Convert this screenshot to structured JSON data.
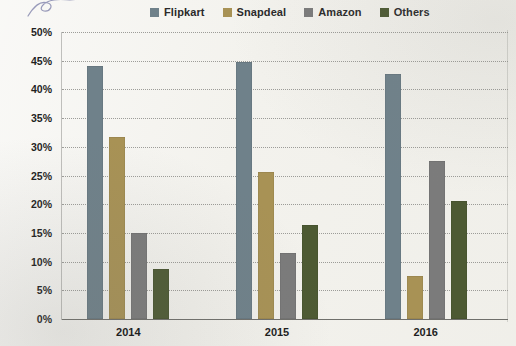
{
  "legend": {
    "items": [
      {
        "label": "Flipkart",
        "color": "#6f818a"
      },
      {
        "label": "Snapdeal",
        "color": "#a89255"
      },
      {
        "label": "Amazon",
        "color": "#7b7b7b"
      },
      {
        "label": "Others",
        "color": "#4d5a33"
      }
    ]
  },
  "chart_data": {
    "type": "bar",
    "title": "",
    "xlabel": "",
    "ylabel": "",
    "categories": [
      "2014",
      "2015",
      "2016"
    ],
    "series": [
      {
        "name": "Flipkart",
        "color": "#6f818a",
        "values": [
          44.0,
          44.7,
          42.6
        ]
      },
      {
        "name": "Snapdeal",
        "color": "#a89255",
        "values": [
          31.7,
          25.6,
          7.5
        ]
      },
      {
        "name": "Amazon",
        "color": "#7b7b7b",
        "values": [
          15.0,
          11.5,
          27.6
        ]
      },
      {
        "name": "Others",
        "color": "#4d5a33",
        "values": [
          8.8,
          16.4,
          20.5
        ]
      }
    ],
    "ylim": [
      0,
      50
    ],
    "ytick_values": [
      0,
      5,
      10,
      15,
      20,
      25,
      30,
      35,
      40,
      45,
      50
    ],
    "ytick_labels": [
      "0%",
      "5%",
      "10%",
      "15%",
      "20%",
      "25%",
      "30%",
      "35%",
      "40%",
      "45%",
      "50%"
    ],
    "grid": true,
    "grid_style": "dotted-horizontal",
    "legend_position": "top"
  },
  "axis": {
    "tick_suffix": "%"
  }
}
